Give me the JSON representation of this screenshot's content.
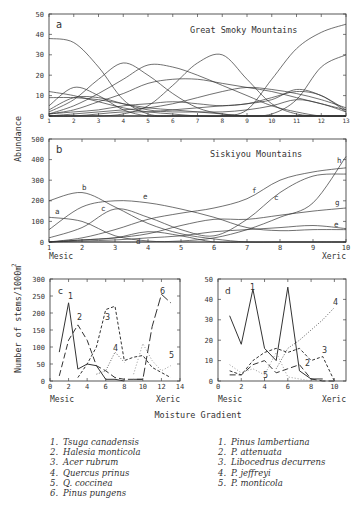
{
  "figure": {
    "y_axis_label_top": "Abundance",
    "y_axis_label_bottom": "Number of stems/1000m",
    "y_axis_label_bottom_sup": "2",
    "x_axis_label": "Moisture Gradient"
  },
  "chart_data": [
    {
      "panel": "a",
      "type": "line",
      "title": "Great Smoky Mountains",
      "xlabel": "",
      "ylabel": "Abundance",
      "xlim": [
        1,
        13
      ],
      "ylim": [
        0,
        50
      ],
      "x_ticks": [
        1,
        2,
        3,
        4,
        5,
        6,
        7,
        8,
        9,
        10,
        11,
        12,
        13
      ],
      "y_ticks": [
        0,
        10,
        20,
        30,
        40,
        50
      ],
      "grid": false,
      "x": [
        1,
        2,
        3,
        4,
        5,
        6,
        7,
        8,
        9,
        10,
        11,
        12,
        13
      ],
      "series": [
        {
          "name": "s1",
          "values": [
            38,
            36,
            24,
            8,
            1,
            0,
            0,
            0,
            0,
            0,
            0,
            0,
            0
          ]
        },
        {
          "name": "s2",
          "values": [
            5,
            14,
            10,
            3,
            0,
            0,
            0,
            0,
            0,
            0,
            0,
            0,
            0
          ]
        },
        {
          "name": "s3",
          "values": [
            2,
            8,
            18,
            26,
            20,
            11,
            4,
            1,
            0,
            0,
            0,
            0,
            0
          ]
        },
        {
          "name": "s4",
          "values": [
            1,
            5,
            11,
            18,
            25,
            24,
            20,
            15,
            10,
            5,
            2,
            0,
            0
          ]
        },
        {
          "name": "s5",
          "values": [
            1,
            3,
            7,
            11,
            16,
            18,
            18,
            16,
            14,
            12,
            9,
            6,
            3
          ]
        },
        {
          "name": "s6",
          "values": [
            0,
            0,
            0,
            1,
            5,
            15,
            26,
            30,
            18,
            6,
            1,
            0,
            0
          ]
        },
        {
          "name": "s7",
          "values": [
            0,
            0,
            0,
            0,
            0,
            0,
            0,
            0,
            3,
            18,
            33,
            41,
            45
          ]
        },
        {
          "name": "s8",
          "values": [
            0,
            0,
            0,
            0,
            0,
            0,
            0,
            0,
            0,
            1,
            8,
            24,
            30
          ]
        },
        {
          "name": "s9",
          "values": [
            12,
            10,
            7,
            4,
            2,
            1,
            0,
            0,
            0,
            0,
            0,
            0,
            0
          ]
        },
        {
          "name": "s10",
          "values": [
            9,
            9,
            8,
            6,
            4,
            3,
            2,
            1,
            0,
            0,
            0,
            0,
            0
          ]
        },
        {
          "name": "s11",
          "values": [
            3,
            9,
            9,
            6,
            3,
            2,
            2,
            2,
            3,
            5,
            8,
            6,
            2
          ]
        },
        {
          "name": "s12",
          "values": [
            0,
            1,
            2,
            3,
            4,
            6,
            9,
            12,
            14,
            13,
            11,
            8,
            4
          ]
        },
        {
          "name": "s13",
          "values": [
            1,
            2,
            3,
            5,
            6,
            7,
            6,
            5,
            6,
            8,
            13,
            10,
            3
          ]
        },
        {
          "name": "s14",
          "values": [
            0,
            0,
            1,
            2,
            2,
            3,
            4,
            5,
            6,
            9,
            12,
            10,
            2
          ]
        }
      ]
    },
    {
      "panel": "b",
      "type": "line",
      "title": "Siskiyou Mountains",
      "xlabel": "",
      "ylabel": "Abundance",
      "xlim": [
        1,
        10
      ],
      "ylim": [
        0,
        500
      ],
      "x_ticks": [
        1,
        2,
        3,
        4,
        5,
        6,
        7,
        8,
        9,
        10
      ],
      "x_tick_extra": {
        "left": "Mesic",
        "right": "Xeric"
      },
      "y_ticks": [
        0,
        100,
        200,
        300,
        400,
        500
      ],
      "grid": false,
      "x": [
        1,
        2,
        3,
        4,
        5,
        6,
        7,
        8,
        9,
        10
      ],
      "series": [
        {
          "name": "a",
          "values": [
            120,
            100,
            30,
            5,
            0,
            0,
            0,
            0,
            0,
            0
          ]
        },
        {
          "name": "b",
          "values": [
            200,
            240,
            170,
            90,
            40,
            15,
            0,
            0,
            0,
            0
          ]
        },
        {
          "name": "c",
          "values": [
            20,
            70,
            160,
            120,
            60,
            30,
            110,
            240,
            320,
            330
          ]
        },
        {
          "name": "d",
          "values": [
            0,
            10,
            20,
            50,
            30,
            0,
            0,
            0,
            0,
            0
          ]
        },
        {
          "name": "e_mid",
          "values": [
            60,
            170,
            200,
            190,
            160,
            120,
            70,
            55,
            60,
            60
          ]
        },
        {
          "name": "f",
          "values": [
            0,
            20,
            60,
            110,
            140,
            165,
            210,
            300,
            340,
            360
          ]
        },
        {
          "name": "g",
          "values": [
            0,
            10,
            20,
            40,
            80,
            110,
            110,
            130,
            150,
            165
          ]
        },
        {
          "name": "e",
          "values": [
            0,
            5,
            10,
            20,
            30,
            50,
            60,
            70,
            80,
            65
          ]
        },
        {
          "name": "h",
          "values": [
            0,
            0,
            0,
            0,
            5,
            20,
            60,
            120,
            190,
            415
          ]
        }
      ],
      "curve_labels": [
        "a",
        "b",
        "c",
        "d",
        "e",
        "f",
        "c",
        "h",
        "g",
        "e"
      ]
    },
    {
      "panel": "c",
      "type": "line",
      "title": "",
      "xlabel": "Mesic → Xeric",
      "ylabel": "Number of stems/1000m²",
      "xlim": [
        0,
        14
      ],
      "ylim": [
        0,
        300
      ],
      "x_ticks": [
        0,
        2,
        4,
        6,
        8,
        10,
        12,
        14
      ],
      "y_ticks": [
        0,
        50,
        100,
        150,
        200,
        250,
        300
      ],
      "grid": false,
      "series": [
        {
          "name": "1. Tsuga canadensis",
          "x": [
            1,
            2,
            3,
            4,
            5,
            6,
            7,
            8
          ],
          "values": [
            85,
            230,
            35,
            50,
            45,
            5,
            5,
            0
          ],
          "style": "solid"
        },
        {
          "name": "2. Halesia monticola",
          "x": [
            1,
            2,
            3,
            4,
            5,
            6,
            7,
            8,
            9,
            10
          ],
          "values": [
            15,
            120,
            165,
            120,
            45,
            30,
            10,
            5,
            5,
            5
          ],
          "style": "dashed"
        },
        {
          "name": "3. Acer rubrum",
          "x": [
            3,
            4,
            5,
            6,
            7,
            8,
            9,
            10,
            11,
            12,
            13
          ],
          "values": [
            10,
            50,
            100,
            210,
            220,
            60,
            70,
            75,
            40,
            25,
            10
          ],
          "style": "short-dash"
        },
        {
          "name": "4. Quercus prinus",
          "x": [
            5,
            6,
            7,
            8
          ],
          "values": [
            20,
            30,
            85,
            55
          ],
          "style": "dotted"
        },
        {
          "name": "5. Q. coccinea",
          "x": [
            9,
            10,
            11,
            12,
            13
          ],
          "values": [
            20,
            110,
            60,
            30,
            45
          ],
          "style": "dotted-light"
        },
        {
          "name": "6. Pinus pungens",
          "x": [
            9,
            10,
            11,
            12,
            13
          ],
          "values": [
            5,
            5,
            160,
            255,
            230
          ],
          "style": "long-dash"
        }
      ]
    },
    {
      "panel": "d",
      "type": "line",
      "title": "",
      "xlabel": "Mesic → Xeric",
      "ylabel": "",
      "xlim": [
        0,
        11
      ],
      "ylim": [
        0,
        50
      ],
      "x_ticks": [
        0,
        2,
        4,
        6,
        8,
        10
      ],
      "y_ticks": [
        0,
        10,
        20,
        30,
        40,
        50
      ],
      "grid": false,
      "series": [
        {
          "name": "1. Pinus lambertiana",
          "x": [
            1,
            2,
            3,
            4,
            5,
            6,
            7,
            8,
            9
          ],
          "values": [
            32,
            18,
            45,
            16,
            10,
            46,
            5,
            1,
            1
          ],
          "style": "solid"
        },
        {
          "name": "2. P. attenuata",
          "x": [
            1,
            2,
            3,
            4,
            5,
            6,
            7,
            8,
            9,
            10
          ],
          "values": [
            3,
            3,
            8,
            10,
            4,
            6,
            8,
            1,
            0,
            0
          ],
          "style": "dashed"
        },
        {
          "name": "3. Libocedrus decurrens",
          "x": [
            1,
            2,
            3,
            4,
            5,
            6,
            7,
            8,
            9,
            10
          ],
          "values": [
            5,
            3,
            10,
            14,
            16,
            14,
            16,
            10,
            12,
            0
          ],
          "style": "short-dash"
        },
        {
          "name": "4. P. jeffreyi",
          "x": [
            5,
            6,
            7,
            8,
            9,
            10
          ],
          "values": [
            6,
            16,
            20,
            25,
            30,
            36
          ],
          "style": "dotted"
        },
        {
          "name": "5. P. monticola",
          "x": [
            1,
            2,
            3,
            4,
            5,
            6,
            7,
            8
          ],
          "values": [
            8,
            4,
            6,
            3,
            14,
            2,
            1,
            0
          ],
          "style": "dotted-light"
        }
      ]
    }
  ],
  "legend_left": [
    {
      "num": "1.",
      "label": "Tsuga canadensis"
    },
    {
      "num": "2.",
      "label": "Halesia monticola"
    },
    {
      "num": "3.",
      "label": "Acer rubrum"
    },
    {
      "num": "4.",
      "label": "Quercus prinus"
    },
    {
      "num": "5.",
      "label": "Q. coccinea"
    },
    {
      "num": "6.",
      "label": "Pinus pungens"
    }
  ],
  "legend_right": [
    {
      "num": "1.",
      "label": "Pinus lambertiana"
    },
    {
      "num": "2.",
      "label": "P. attenuata"
    },
    {
      "num": "3.",
      "label": "Libocedrus decurrens"
    },
    {
      "num": "4.",
      "label": "P. jeffreyi"
    },
    {
      "num": "5.",
      "label": "P. monticola"
    }
  ],
  "labels": {
    "panel_a": "a",
    "panel_b": "b",
    "panel_c": "c",
    "panel_d": "d",
    "mesic": "Mesic",
    "xeric": "Xeric"
  }
}
